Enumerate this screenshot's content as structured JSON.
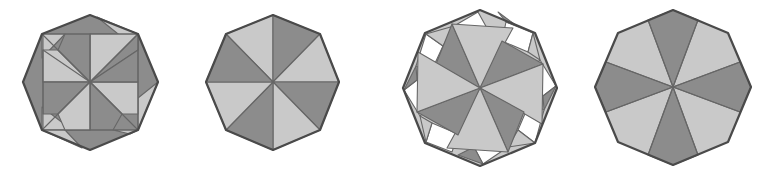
{
  "figure": {
    "colors": {
      "dark": "#8c8c8c",
      "light": "#c9c9c9",
      "white": "#ffffff",
      "stroke": "#4a4a4a"
    },
    "octagons": [
      {
        "id": 1,
        "label": "octagon-square-pinwheel",
        "pattern": "inner square pinwheel with corner triangles"
      },
      {
        "id": 2,
        "label": "octagon-8-sectors",
        "pattern": "8 alternating vertex-to-center sectors"
      },
      {
        "id": 3,
        "label": "octagon-pinwheel-with-squares",
        "pattern": "pinwheel blades with white squares along edges"
      },
      {
        "id": 4,
        "label": "octagon-8-wedges",
        "pattern": "8 alternating wedges from center to edges"
      }
    ]
  }
}
